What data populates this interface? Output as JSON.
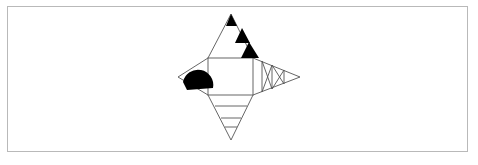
{
  "canvas": {
    "width": 478,
    "height": 165,
    "background_color": "#ffffff",
    "frame": {
      "x": 7,
      "y": 6,
      "width": 461,
      "height": 146,
      "border_color": "#b9b9b9",
      "border_width": 1
    }
  },
  "figure": {
    "stroke_color": "#555555",
    "fill_color": "#000000",
    "stroke_width": 0.9,
    "center_square": {
      "x": 208,
      "y": 58,
      "width": 45,
      "height": 37
    },
    "tips": {
      "top": {
        "x": 231,
        "y": 14
      },
      "left": {
        "x": 178,
        "y": 77
      },
      "right": {
        "x": 300,
        "y": 77
      },
      "bottom": {
        "x": 231,
        "y": 140
      }
    },
    "points": [
      {
        "name": "square-top-left",
        "x": 208,
        "y": 58
      },
      {
        "name": "square-top-right",
        "x": 253,
        "y": 58
      },
      {
        "name": "square-bottom-right",
        "x": 253,
        "y": 95
      },
      {
        "name": "square-bottom-left",
        "x": 208,
        "y": 95
      },
      {
        "name": "apex-top",
        "x": 231,
        "y": 14
      },
      {
        "name": "apex-left",
        "x": 178,
        "y": 77
      },
      {
        "name": "apex-right",
        "x": 300,
        "y": 77
      },
      {
        "name": "apex-bottom",
        "x": 231,
        "y": 140
      }
    ],
    "top_spike": {
      "label": "top triangle with sierpinski black sub-triangles",
      "black_triangles": [
        {
          "index": 1,
          "ax": 231,
          "ay": 14,
          "bx": 237,
          "by": 26,
          "cx": 226,
          "cy": 26
        },
        {
          "index": 2,
          "ax": 242,
          "ay": 28,
          "bx": 250,
          "by": 43,
          "cx": 235,
          "cy": 43
        },
        {
          "index": 3,
          "ax": 249,
          "ay": 42,
          "bx": 259,
          "by": 58,
          "cx": 241,
          "cy": 58
        }
      ]
    },
    "left_spike": {
      "label": "left triangle with filled black half-disc",
      "blob": {
        "tip_x": 183,
        "tip_y": 82,
        "center_x": 199,
        "center_y": 88,
        "radius": 14
      }
    },
    "right_spike": {
      "label": "right triangle subdivided with vertical lines and crossing diagonals",
      "vertical_dividers": [
        {
          "x": 262,
          "y_top": 61,
          "y_bottom": 92
        },
        {
          "x": 272,
          "y_top": 65,
          "y_bottom": 89
        },
        {
          "x": 284,
          "y_top": 70,
          "y_bottom": 84
        }
      ],
      "cross_segments": [
        {
          "x1": 272,
          "y1": 65,
          "x2": 284,
          "y2": 84
        },
        {
          "x1": 272,
          "y1": 89,
          "x2": 284,
          "y2": 70
        },
        {
          "x1": 262,
          "y1": 61,
          "x2": 272,
          "y2": 89
        },
        {
          "x1": 262,
          "y1": 92,
          "x2": 272,
          "y2": 65
        }
      ]
    },
    "bottom_spike": {
      "label": "bottom triangle with horizontal band dividers",
      "horizontal_dividers": [
        {
          "y": 106,
          "x_left": 215,
          "x_right": 247
        },
        {
          "y": 118,
          "x_left": 221,
          "x_right": 241
        },
        {
          "y": 127,
          "x_left": 225,
          "x_right": 237
        }
      ]
    }
  }
}
